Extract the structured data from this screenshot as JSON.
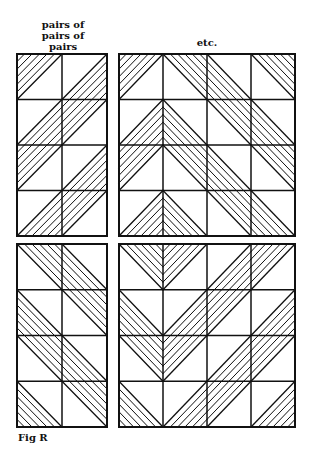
{
  "labels": {
    "left_header": "pairs of pairs of pairs",
    "left_header_lines": [
      "pairs of",
      "pairs of",
      "pairs"
    ],
    "right_header": "etc.",
    "caption": "Fig R"
  },
  "style": {
    "stroke": "#111111",
    "background": "#ffffff",
    "hatch_lines_per_triangle": 5
  },
  "panels": [
    {
      "id": "top-left",
      "x": 17,
      "y": 54,
      "w": 90,
      "h": 182,
      "cols": 2,
      "rows": 4,
      "cells": [
        [
          {
            "diag": "/",
            "hatch": "UL"
          },
          {
            "diag": "/",
            "hatch": "LR"
          }
        ],
        [
          {
            "diag": "/",
            "hatch": "LR"
          },
          {
            "diag": "/",
            "hatch": "UL"
          }
        ],
        [
          {
            "diag": "/",
            "hatch": "UL"
          },
          {
            "diag": "/",
            "hatch": "LR"
          }
        ],
        [
          {
            "diag": "/",
            "hatch": "LR"
          },
          {
            "diag": "/",
            "hatch": "UL"
          }
        ]
      ]
    },
    {
      "id": "top-right",
      "x": 119,
      "y": 54,
      "w": 176,
      "h": 182,
      "cols": 4,
      "rows": 4,
      "cells": [
        [
          {
            "diag": "/",
            "hatch": "UL"
          },
          {
            "diag": "\\",
            "hatch": "UR"
          },
          {
            "diag": "\\",
            "hatch": "LL"
          },
          {
            "diag": "\\",
            "hatch": "UR"
          }
        ],
        [
          {
            "diag": "/",
            "hatch": "LR"
          },
          {
            "diag": "\\",
            "hatch": "LL"
          },
          {
            "diag": "\\",
            "hatch": "UR"
          },
          {
            "diag": "\\",
            "hatch": "LL"
          }
        ],
        [
          {
            "diag": "/",
            "hatch": "UL"
          },
          {
            "diag": "\\",
            "hatch": "UR"
          },
          {
            "diag": "\\",
            "hatch": "LL"
          },
          {
            "diag": "\\",
            "hatch": "UR"
          }
        ],
        [
          {
            "diag": "/",
            "hatch": "LR"
          },
          {
            "diag": "\\",
            "hatch": "LL"
          },
          {
            "diag": "\\",
            "hatch": "UR"
          },
          {
            "diag": "\\",
            "hatch": "LL"
          }
        ]
      ]
    },
    {
      "id": "bottom-left",
      "x": 17,
      "y": 244,
      "w": 90,
      "h": 183,
      "cols": 2,
      "rows": 4,
      "cells": [
        [
          {
            "diag": "\\",
            "hatch": "UR"
          },
          {
            "diag": "\\",
            "hatch": "LL"
          }
        ],
        [
          {
            "diag": "\\",
            "hatch": "LL"
          },
          {
            "diag": "\\",
            "hatch": "UR"
          }
        ],
        [
          {
            "diag": "\\",
            "hatch": "UR"
          },
          {
            "diag": "\\",
            "hatch": "LL"
          }
        ],
        [
          {
            "diag": "\\",
            "hatch": "LL"
          },
          {
            "diag": "\\",
            "hatch": "UR"
          }
        ]
      ]
    },
    {
      "id": "bottom-right",
      "x": 119,
      "y": 244,
      "w": 176,
      "h": 183,
      "cols": 4,
      "rows": 4,
      "cells": [
        [
          {
            "diag": "\\",
            "hatch": "UR"
          },
          {
            "diag": "/",
            "hatch": "UL"
          },
          {
            "diag": "/",
            "hatch": "LR"
          },
          {
            "diag": "/",
            "hatch": "UL"
          }
        ],
        [
          {
            "diag": "\\",
            "hatch": "LL"
          },
          {
            "diag": "/",
            "hatch": "LR"
          },
          {
            "diag": "/",
            "hatch": "UL"
          },
          {
            "diag": "/",
            "hatch": "LR"
          }
        ],
        [
          {
            "diag": "\\",
            "hatch": "UR"
          },
          {
            "diag": "/",
            "hatch": "UL"
          },
          {
            "diag": "/",
            "hatch": "LR"
          },
          {
            "diag": "/",
            "hatch": "UL"
          }
        ],
        [
          {
            "diag": "\\",
            "hatch": "LL"
          },
          {
            "diag": "/",
            "hatch": "LR"
          },
          {
            "diag": "/",
            "hatch": "UL"
          },
          {
            "diag": "/",
            "hatch": "LR"
          }
        ]
      ]
    }
  ]
}
